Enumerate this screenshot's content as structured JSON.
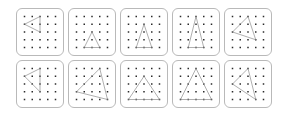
{
  "figure": {
    "rows": 2,
    "columns": 5,
    "panel_count": 10,
    "grid_size": 5,
    "colors": {
      "background": "#ffffff",
      "panel_border": "#b9b9b9",
      "dot": "#2b2b2b",
      "triangle_stroke": "#8c8c8c"
    }
  },
  "chart_data": {
    "type": "scatter",
    "xlabel": "",
    "ylabel": "",
    "grid": true,
    "legend_position": "none",
    "x": [
      0,
      1,
      2,
      3,
      4
    ],
    "y": [
      0,
      1,
      2,
      3,
      4
    ],
    "xlim": [
      0,
      4
    ],
    "ylim": [
      0,
      4
    ],
    "panels": [
      {
        "index": 1,
        "row": 1,
        "column": 1,
        "shape": "triangle",
        "vertices": [
          [
            0,
            3
          ],
          [
            2,
            4
          ],
          [
            2,
            2
          ]
        ]
      },
      {
        "index": 2,
        "row": 1,
        "column": 2,
        "shape": "triangle",
        "vertices": [
          [
            1,
            0
          ],
          [
            2,
            2
          ],
          [
            3,
            0
          ]
        ]
      },
      {
        "index": 3,
        "row": 1,
        "column": 3,
        "shape": "triangle",
        "vertices": [
          [
            1,
            0
          ],
          [
            2,
            3
          ],
          [
            3,
            0
          ]
        ]
      },
      {
        "index": 4,
        "row": 1,
        "column": 4,
        "shape": "triangle",
        "vertices": [
          [
            1,
            0
          ],
          [
            2,
            4
          ],
          [
            3,
            0
          ]
        ]
      },
      {
        "index": 5,
        "row": 1,
        "column": 5,
        "shape": "triangle",
        "vertices": [
          [
            0,
            2
          ],
          [
            2,
            4
          ],
          [
            3,
            1
          ]
        ]
      },
      {
        "index": 6,
        "row": 2,
        "column": 1,
        "shape": "triangle",
        "vertices": [
          [
            0,
            3
          ],
          [
            2,
            4
          ],
          [
            2,
            1
          ]
        ]
      },
      {
        "index": 7,
        "row": 2,
        "column": 2,
        "shape": "triangle",
        "vertices": [
          [
            0,
            1
          ],
          [
            3,
            4
          ],
          [
            4,
            0
          ]
        ]
      },
      {
        "index": 8,
        "row": 2,
        "column": 3,
        "shape": "triangle",
        "vertices": [
          [
            0,
            0
          ],
          [
            2,
            3
          ],
          [
            4,
            0
          ]
        ]
      },
      {
        "index": 9,
        "row": 2,
        "column": 4,
        "shape": "triangle",
        "vertices": [
          [
            0,
            0
          ],
          [
            2,
            4
          ],
          [
            4,
            0
          ]
        ]
      },
      {
        "index": 10,
        "row": 2,
        "column": 5,
        "shape": "triangle",
        "vertices": [
          [
            0,
            2
          ],
          [
            2,
            4
          ],
          [
            3,
            0
          ]
        ]
      }
    ]
  }
}
